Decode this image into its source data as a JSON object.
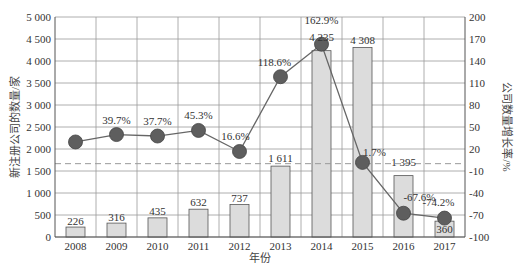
{
  "chart_data": {
    "type": "bar+line",
    "title": "",
    "xlabel": "年份",
    "ylabel_left": "新注册公司的数量/家",
    "ylabel_right": "公司数量增长率/%",
    "categories": [
      "2008",
      "2009",
      "2010",
      "2011",
      "2012",
      "2013",
      "2014",
      "2015",
      "2016",
      "2017"
    ],
    "series": [
      {
        "name": "新注册公司的数量",
        "type": "bar",
        "axis": "left",
        "values": [
          226,
          316,
          435,
          632,
          737,
          1611,
          4235,
          4308,
          1395,
          360
        ],
        "labels": [
          "226",
          "316",
          "435",
          "632",
          "737",
          "1 611",
          "4 235",
          "4 308",
          "1 395",
          "360"
        ],
        "color": "#dcdcdc"
      },
      {
        "name": "公司数量增长率",
        "type": "line",
        "axis": "right",
        "values": [
          29.6,
          39.7,
          37.7,
          45.3,
          16.6,
          118.6,
          162.9,
          1.7,
          -67.6,
          -74.2
        ],
        "labels": [
          "",
          "39.7%",
          "37.7%",
          "45.3%",
          "16.6%",
          "118.6%",
          "162.9%",
          "1.7%",
          "-67.6%",
          "-74.2%"
        ],
        "color": "#666666"
      }
    ],
    "ylim_left": [
      0,
      5000
    ],
    "yticks_left": [
      "0",
      "500",
      "1 000",
      "1 500",
      "2 000",
      "2 500",
      "3 000",
      "3 500",
      "4 000",
      "4 500",
      "5 000"
    ],
    "ylim_right": [
      -100,
      200
    ],
    "yticks_right": [
      "-100",
      "-70",
      "-40",
      "-10",
      "20",
      "50",
      "80",
      "110",
      "140",
      "170",
      "200"
    ],
    "reference_line": {
      "axis": "right",
      "value": 0,
      "style": "dashed"
    },
    "grid": true,
    "legend": "none"
  }
}
